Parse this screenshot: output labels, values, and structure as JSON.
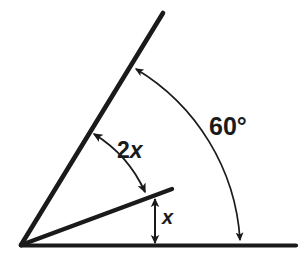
{
  "figure": {
    "background_color": "#ffffff",
    "stroke_color": "#1a1a1a",
    "canvas": {
      "width": 308,
      "height": 264
    }
  },
  "labels": {
    "outer_angle": "60°",
    "upper_angle": "2x",
    "upper_angle_coefficient": "2",
    "upper_angle_variable": "x",
    "lower_angle": "x"
  },
  "geometry": {
    "vertex": {
      "x": 21,
      "y": 245
    },
    "rays": [
      {
        "name": "baseline-ray",
        "angle_degrees": 0,
        "from": {
          "x": 21,
          "y": 245
        },
        "to": {
          "x": 296,
          "y": 245
        }
      },
      {
        "name": "middle-ray",
        "angle_degrees": 20,
        "from": {
          "x": 21,
          "y": 245
        },
        "to": {
          "x": 172,
          "y": 189
        }
      },
      {
        "name": "upper-ray",
        "angle_degrees": 60,
        "from": {
          "x": 21,
          "y": 245
        },
        "to": {
          "x": 163,
          "y": 13
        }
      }
    ],
    "arcs": [
      {
        "name": "outer-angle-arc",
        "label": "60°",
        "radius": 215,
        "start": {
          "x": 136,
          "y": 69
        },
        "end": {
          "x": 240,
          "y": 240
        },
        "arrowheads": "both"
      },
      {
        "name": "upper-angle-arc",
        "label": "2x",
        "radius": 131,
        "start": {
          "x": 94,
          "y": 134
        },
        "end": {
          "x": 145,
          "y": 192
        },
        "arrowheads": "both"
      }
    ],
    "measure_arrows": [
      {
        "name": "lower-angle-arrow",
        "label": "x",
        "orientation": "vertical",
        "x": 155,
        "y_top": 199,
        "y_bottom": 243,
        "arrowheads": "both"
      }
    ]
  }
}
